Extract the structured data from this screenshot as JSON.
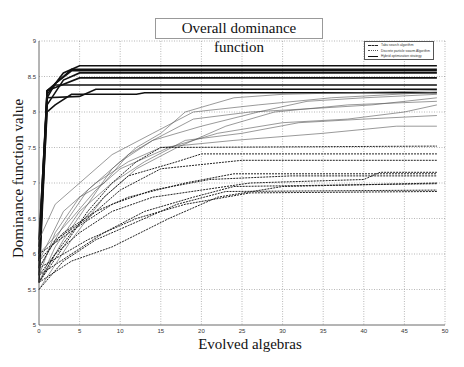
{
  "chart_data": {
    "type": "line",
    "title": "Overall dominance function",
    "xlabel": "Evolved algebras",
    "ylabel": "Dominance function value",
    "xlim": [
      0,
      50
    ],
    "ylim": [
      5,
      9
    ],
    "xticks": [
      0,
      5,
      10,
      15,
      20,
      25,
      30,
      35,
      40,
      45,
      50
    ],
    "yticks": [
      5,
      5.5,
      6,
      6.5,
      7,
      7.5,
      8,
      8.5,
      9
    ],
    "grid": true,
    "legend_position": "upper right",
    "legend": [
      "Tabu search algorithm",
      "Discrete particle swarm Algorithm",
      "Hybrid optimization strategy"
    ],
    "series": [
      {
        "name": "Hybrid optimization strategy",
        "style": "solid",
        "points": [
          [
            0,
            5.9
          ],
          [
            1,
            8.25
          ],
          [
            3,
            8.55
          ],
          [
            5,
            8.65
          ],
          [
            49,
            8.65
          ]
        ]
      },
      {
        "name": "Hybrid optimization strategy",
        "style": "solid",
        "points": [
          [
            0,
            6.0
          ],
          [
            1,
            8.3
          ],
          [
            3,
            8.5
          ],
          [
            4,
            8.6
          ],
          [
            49,
            8.6
          ]
        ]
      },
      {
        "name": "Hybrid optimization strategy",
        "style": "solid",
        "points": [
          [
            0,
            6.2
          ],
          [
            1,
            8.2
          ],
          [
            2,
            8.4
          ],
          [
            4,
            8.58
          ],
          [
            49,
            8.58
          ]
        ]
      },
      {
        "name": "Hybrid optimization strategy",
        "style": "solid",
        "points": [
          [
            0,
            5.6
          ],
          [
            1,
            8.1
          ],
          [
            3,
            8.45
          ],
          [
            5,
            8.55
          ],
          [
            49,
            8.55
          ]
        ]
      },
      {
        "name": "Hybrid optimization strategy",
        "style": "solid",
        "points": [
          [
            0,
            5.8
          ],
          [
            1,
            8.3
          ],
          [
            5,
            8.48
          ],
          [
            49,
            8.48
          ]
        ]
      },
      {
        "name": "Hybrid optimization strategy",
        "style": "solid",
        "points": [
          [
            0,
            6.1
          ],
          [
            1,
            8.3
          ],
          [
            2,
            8.38
          ],
          [
            49,
            8.38
          ]
        ]
      },
      {
        "name": "Hybrid optimization strategy",
        "style": "solid",
        "points": [
          [
            0,
            5.7
          ],
          [
            1,
            8.2
          ],
          [
            5,
            8.22
          ],
          [
            7,
            8.32
          ],
          [
            49,
            8.32
          ]
        ]
      },
      {
        "name": "Hybrid optimization strategy",
        "style": "solid",
        "points": [
          [
            0,
            5.9
          ],
          [
            1,
            8.0
          ],
          [
            2,
            8.1
          ],
          [
            4,
            8.25
          ],
          [
            12,
            8.25
          ],
          [
            13,
            8.27
          ],
          [
            49,
            8.27
          ]
        ]
      },
      {
        "name": "Discrete particle swarm Algorithm",
        "style": "thin",
        "points": [
          [
            0,
            5.6
          ],
          [
            3,
            6.2
          ],
          [
            6,
            6.7
          ],
          [
            9,
            7.2
          ],
          [
            12,
            7.5
          ],
          [
            15,
            7.7
          ],
          [
            18,
            8.0
          ],
          [
            21,
            8.1
          ],
          [
            24,
            8.2
          ],
          [
            30,
            8.25
          ],
          [
            49,
            8.3
          ]
        ]
      },
      {
        "name": "Discrete particle swarm Algorithm",
        "style": "thin",
        "points": [
          [
            0,
            5.7
          ],
          [
            2,
            6.3
          ],
          [
            5,
            6.8
          ],
          [
            8,
            7.0
          ],
          [
            11,
            7.4
          ],
          [
            14,
            7.6
          ],
          [
            20,
            7.8
          ],
          [
            27,
            8.0
          ],
          [
            33,
            8.15
          ],
          [
            40,
            8.2
          ],
          [
            49,
            8.25
          ]
        ]
      },
      {
        "name": "Discrete particle swarm Algorithm",
        "style": "thin",
        "points": [
          [
            0,
            5.8
          ],
          [
            3,
            6.4
          ],
          [
            6,
            6.9
          ],
          [
            10,
            7.3
          ],
          [
            14,
            7.6
          ],
          [
            19,
            7.9
          ],
          [
            26,
            8.0
          ],
          [
            34,
            8.05
          ],
          [
            41,
            8.1
          ],
          [
            49,
            8.2
          ]
        ]
      },
      {
        "name": "Discrete particle swarm Algorithm",
        "style": "thin",
        "points": [
          [
            0,
            6.0
          ],
          [
            4,
            6.5
          ],
          [
            7,
            6.9
          ],
          [
            10,
            7.2
          ],
          [
            16,
            7.5
          ],
          [
            22,
            7.7
          ],
          [
            30,
            7.85
          ],
          [
            38,
            7.9
          ],
          [
            45,
            8.0
          ],
          [
            49,
            8.1
          ]
        ]
      },
      {
        "name": "Discrete particle swarm Algorithm",
        "style": "thin",
        "points": [
          [
            0,
            5.6
          ],
          [
            2,
            6.1
          ],
          [
            5,
            6.6
          ],
          [
            9,
            7.0
          ],
          [
            13,
            7.3
          ],
          [
            18,
            7.6
          ],
          [
            25,
            7.7
          ],
          [
            32,
            7.85
          ],
          [
            40,
            7.9
          ],
          [
            49,
            7.95
          ]
        ]
      },
      {
        "name": "Discrete particle swarm Algorithm",
        "style": "thin",
        "points": [
          [
            0,
            5.9
          ],
          [
            3,
            6.6
          ],
          [
            7,
            7.0
          ],
          [
            11,
            7.3
          ],
          [
            15,
            7.5
          ],
          [
            24,
            7.6
          ],
          [
            35,
            7.7
          ],
          [
            44,
            7.8
          ],
          [
            49,
            7.8
          ]
        ]
      },
      {
        "name": "Discrete particle swarm Algorithm",
        "style": "thin",
        "points": [
          [
            0,
            6.2
          ],
          [
            2,
            6.7
          ],
          [
            5,
            7.0
          ],
          [
            9,
            7.4
          ],
          [
            14,
            7.7
          ],
          [
            19,
            8.0
          ],
          [
            27,
            8.1
          ],
          [
            36,
            8.2
          ],
          [
            49,
            8.28
          ]
        ]
      },
      {
        "name": "Discrete particle swarm Algorithm",
        "style": "thin",
        "points": [
          [
            0,
            5.5
          ],
          [
            4,
            6.2
          ],
          [
            8,
            6.8
          ],
          [
            12,
            7.2
          ],
          [
            17,
            7.5
          ],
          [
            23,
            7.8
          ],
          [
            29,
            8.0
          ],
          [
            38,
            8.1
          ],
          [
            49,
            8.15
          ]
        ]
      },
      {
        "name": "Tabu search algorithm",
        "style": "dashed",
        "points": [
          [
            0,
            5.6
          ],
          [
            3,
            6.1
          ],
          [
            6,
            6.6
          ],
          [
            9,
            7.0
          ],
          [
            12,
            7.3
          ],
          [
            15,
            7.5
          ],
          [
            49,
            7.52
          ]
        ]
      },
      {
        "name": "Tabu search algorithm",
        "style": "dashed",
        "points": [
          [
            0,
            5.7
          ],
          [
            4,
            6.3
          ],
          [
            8,
            6.8
          ],
          [
            11,
            7.1
          ],
          [
            17,
            7.3
          ],
          [
            20,
            7.41
          ],
          [
            49,
            7.41
          ]
        ]
      },
      {
        "name": "Tabu search algorithm",
        "style": "dashed",
        "points": [
          [
            0,
            5.8
          ],
          [
            2,
            6.2
          ],
          [
            6,
            6.5
          ],
          [
            10,
            6.9
          ],
          [
            15,
            7.2
          ],
          [
            25,
            7.32
          ],
          [
            49,
            7.32
          ]
        ]
      },
      {
        "name": "Tabu search algorithm",
        "style": "dashed",
        "points": [
          [
            0,
            5.9
          ],
          [
            3,
            6.3
          ],
          [
            7,
            6.6
          ],
          [
            11,
            6.8
          ],
          [
            18,
            7.0
          ],
          [
            24,
            7.13
          ],
          [
            49,
            7.13
          ]
        ]
      },
      {
        "name": "Tabu search algorithm",
        "style": "dashed",
        "points": [
          [
            0,
            5.6
          ],
          [
            2,
            6.0
          ],
          [
            5,
            6.3
          ],
          [
            9,
            6.6
          ],
          [
            14,
            6.8
          ],
          [
            20,
            6.9
          ],
          [
            26,
            7.0
          ],
          [
            40,
            7.05
          ],
          [
            42,
            7.15
          ],
          [
            49,
            7.15
          ]
        ]
      },
      {
        "name": "Tabu search algorithm",
        "style": "dashed",
        "points": [
          [
            0,
            5.7
          ],
          [
            4,
            6.0
          ],
          [
            8,
            6.3
          ],
          [
            13,
            6.6
          ],
          [
            19,
            6.8
          ],
          [
            24,
            6.95
          ],
          [
            49,
            6.99
          ]
        ]
      },
      {
        "name": "Tabu search algorithm",
        "style": "dashed",
        "points": [
          [
            0,
            5.5
          ],
          [
            3,
            5.9
          ],
          [
            7,
            6.2
          ],
          [
            11,
            6.4
          ],
          [
            17,
            6.7
          ],
          [
            23,
            6.88
          ],
          [
            49,
            6.9
          ]
        ]
      },
      {
        "name": "Tabu search algorithm",
        "style": "dashed",
        "points": [
          [
            0,
            6.0
          ],
          [
            5,
            6.4
          ],
          [
            9,
            6.7
          ],
          [
            14,
            6.9
          ],
          [
            21,
            7.05
          ],
          [
            31,
            7.1
          ],
          [
            49,
            7.1
          ]
        ]
      },
      {
        "name": "Tabu search algorithm",
        "style": "dashed",
        "points": [
          [
            0,
            5.8
          ],
          [
            6,
            6.2
          ],
          [
            12,
            6.5
          ],
          [
            18,
            6.7
          ],
          [
            26,
            6.86
          ],
          [
            49,
            6.88
          ]
        ]
      },
      {
        "name": "Tabu search algorithm",
        "style": "dashed",
        "points": [
          [
            0,
            5.6
          ],
          [
            4,
            5.9
          ],
          [
            9,
            6.1
          ],
          [
            16,
            6.5
          ],
          [
            22,
            6.8
          ],
          [
            30,
            6.95
          ],
          [
            49,
            7.0
          ]
        ]
      }
    ]
  }
}
